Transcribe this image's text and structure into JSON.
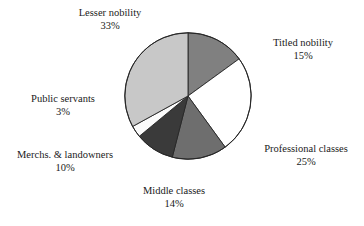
{
  "chart_data": {
    "type": "pie",
    "title": "",
    "xlabel": "",
    "ylabel": "",
    "legend": "none",
    "grid": false,
    "start_angle_deg": 0,
    "direction": "clockwise",
    "categories": [
      "Titled nobility",
      "Professional classes",
      "Middle classes",
      "Merchs. & landowners",
      "Public servants",
      "Lesser nobility"
    ],
    "values": [
      15,
      25,
      14,
      10,
      3,
      33
    ],
    "units": "%",
    "slices": [
      {
        "label": "Titled nobility",
        "value": 15,
        "value_text": "15%",
        "color": "#808080"
      },
      {
        "label": "Professional classes",
        "value": 25,
        "value_text": "25%",
        "color": "#ffffff"
      },
      {
        "label": "Middle classes",
        "value": 14,
        "value_text": "14%",
        "color": "#6e6e6e"
      },
      {
        "label": "Merchs. & landowners",
        "value": 10,
        "value_text": "10%",
        "color": "#3a3a3a"
      },
      {
        "label": "Public servants",
        "value": 3,
        "value_text": "3%",
        "color": "#fbfbfb"
      },
      {
        "label": "Lesser nobility",
        "value": 33,
        "value_text": "33%",
        "color": "#c8c8c8"
      }
    ],
    "outline_color": "#262626"
  },
  "labels": {
    "lesser_nobility": {
      "name": "Lesser nobility",
      "pct": "33%"
    },
    "titled_nobility": {
      "name": "Titled nobility",
      "pct": "15%"
    },
    "professional_classes": {
      "name": "Professional classes",
      "pct": "25%"
    },
    "middle_classes": {
      "name": "Middle classes",
      "pct": "14%"
    },
    "merchs_landowners": {
      "name": "Merchs. & landowners",
      "pct": "10%"
    },
    "public_servants": {
      "name": "Public servants",
      "pct": "3%"
    }
  }
}
